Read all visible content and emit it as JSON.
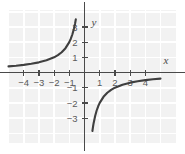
{
  "figure": {
    "title": "",
    "background_color": "#ffffff",
    "plot_background_color": "#f2f2f2",
    "grid_line_color": "#ffffff",
    "axis_color": "#4a4a4a",
    "curve_color": "#3f3f3f",
    "tick_label_color": "#5a5a5a"
  },
  "chart_data": {
    "type": "line",
    "title": "",
    "xlabel": "x",
    "ylabel": "y",
    "xlim": [
      -5,
      5
    ],
    "ylim": [
      -3.9,
      3.5
    ],
    "grid": true,
    "legend": null,
    "x_ticks": [
      -4,
      -3,
      -2,
      -1,
      1,
      2,
      3,
      4
    ],
    "x_tick_labels": [
      "-4",
      "-3",
      "-2",
      "-1",
      "1",
      "2",
      "3",
      "4"
    ],
    "y_ticks": [
      -3,
      -2,
      -1,
      1,
      2,
      3
    ],
    "y_tick_labels": [
      "-3",
      "-2",
      "-1",
      "1",
      "2",
      "3"
    ],
    "series": [
      {
        "name": "y = -2/x (left branch)",
        "equation": "y = -2/x",
        "branch": "x < 0",
        "points": [
          [
            -5.0,
            0.4
          ],
          [
            -4.5,
            0.444
          ],
          [
            -4.0,
            0.5
          ],
          [
            -3.5,
            0.571
          ],
          [
            -3.0,
            0.667
          ],
          [
            -2.5,
            0.8
          ],
          [
            -2.0,
            1.0
          ],
          [
            -1.75,
            1.143
          ],
          [
            -1.5,
            1.333
          ],
          [
            -1.25,
            1.6
          ],
          [
            -1.0,
            2.0
          ],
          [
            -0.9,
            2.222
          ],
          [
            -0.8,
            2.5
          ],
          [
            -0.7,
            2.857
          ],
          [
            -0.62,
            3.226
          ],
          [
            -0.57,
            3.5
          ]
        ]
      },
      {
        "name": "y = -2/x (right branch)",
        "equation": "y = -2/x",
        "branch": "x > 0",
        "points": [
          [
            0.52,
            -3.85
          ],
          [
            0.56,
            -3.571
          ],
          [
            0.6,
            -3.333
          ],
          [
            0.7,
            -2.857
          ],
          [
            0.8,
            -2.5
          ],
          [
            0.9,
            -2.222
          ],
          [
            1.0,
            -2.0
          ],
          [
            1.25,
            -1.6
          ],
          [
            1.5,
            -1.333
          ],
          [
            1.75,
            -1.143
          ],
          [
            2.0,
            -1.0
          ],
          [
            2.5,
            -0.8
          ],
          [
            3.0,
            -0.667
          ],
          [
            3.5,
            -0.571
          ],
          [
            4.0,
            -0.5
          ],
          [
            4.5,
            -0.444
          ],
          [
            5.0,
            -0.4
          ]
        ]
      }
    ],
    "asymptotes": {
      "vertical": 0,
      "horizontal": 0
    }
  }
}
